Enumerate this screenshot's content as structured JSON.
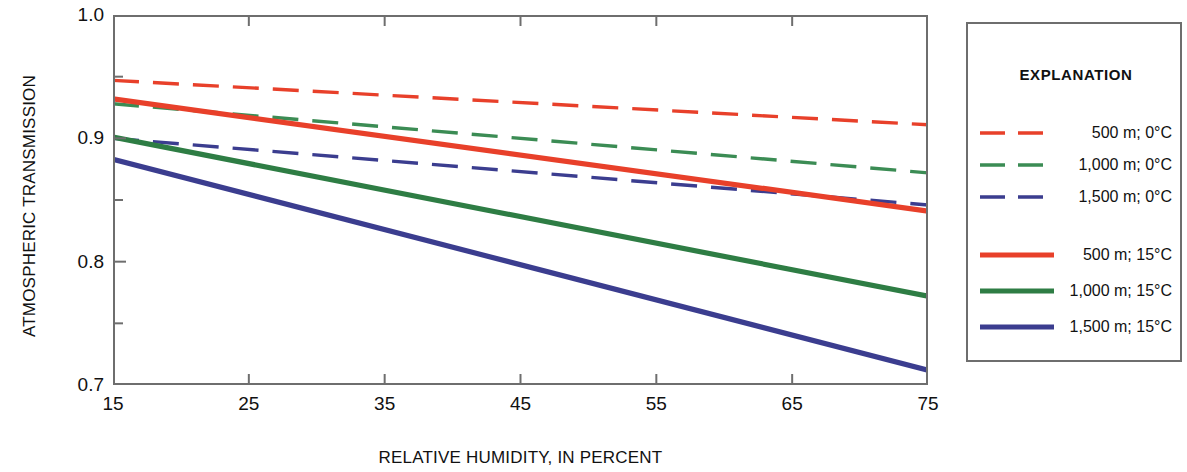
{
  "chart_data": {
    "type": "line",
    "title": "",
    "xlabel": "RELATIVE HUMIDITY, IN PERCENT",
    "ylabel": "ATMOSPHERIC TRANSMISSION",
    "xlim": [
      15,
      75
    ],
    "ylim": [
      0.7,
      1.0
    ],
    "xticks": [
      15,
      25,
      35,
      45,
      55,
      65,
      75
    ],
    "xtick_labels": [
      "15",
      "25",
      "35",
      "45",
      "55",
      "65",
      "75"
    ],
    "yticks": [
      0.7,
      0.8,
      0.9,
      1.0
    ],
    "ytick_labels": [
      "0.7",
      "0.8",
      "0.9",
      "1.0"
    ],
    "yminorticks": [
      0.75,
      0.85,
      0.95
    ],
    "grid": false,
    "legend_position": "right-outside",
    "legend_title": "EXPLANATION",
    "x": [
      15,
      75
    ],
    "series": [
      {
        "name": "500 m; 0°C",
        "color": "#e8402a",
        "style": "dashed",
        "values": [
          0.947,
          0.911
        ]
      },
      {
        "name": "1,000 m; 0°C",
        "color": "#3b8c54",
        "style": "dashed",
        "values": [
          0.928,
          0.872
        ]
      },
      {
        "name": "1,500 m; 0°C",
        "color": "#3b3d8f",
        "style": "dashed",
        "values": [
          0.9,
          0.846
        ]
      },
      {
        "name": "500 m; 15°C",
        "color": "#e8402a",
        "style": "solid",
        "values": [
          0.932,
          0.841
        ]
      },
      {
        "name": "1,000 m; 15°C",
        "color": "#2e7d44",
        "style": "solid",
        "values": [
          0.901,
          0.772
        ]
      },
      {
        "name": "1,500 m; 15°C",
        "color": "#3b3d8f",
        "style": "solid",
        "values": [
          0.883,
          0.712
        ]
      }
    ]
  },
  "legend": {
    "title": "EXPLANATION",
    "entries": [
      {
        "label": "500 m; 0°C",
        "color": "#e8402a",
        "style": "dashed"
      },
      {
        "label": "1,000 m; 0°C",
        "color": "#3b8c54",
        "style": "dashed"
      },
      {
        "label": "1,500 m; 0°C",
        "color": "#3b3d8f",
        "style": "dashed"
      },
      {
        "label": "500 m; 15°C",
        "color": "#e8402a",
        "style": "solid"
      },
      {
        "label": "1,000 m; 15°C",
        "color": "#2e7d44",
        "style": "solid"
      },
      {
        "label": "1,500 m; 15°C",
        "color": "#3b3d8f",
        "style": "solid"
      }
    ]
  },
  "axes": {
    "x_title": "RELATIVE HUMIDITY, IN PERCENT",
    "y_title": "ATMOSPHERIC TRANSMISSION"
  },
  "colors": {
    "red": "#e8402a",
    "green_light": "#3b8c54",
    "green_dark": "#2e7d44",
    "blue": "#3b3d8f",
    "axis": "#6e6e6e",
    "text": "#111111"
  }
}
